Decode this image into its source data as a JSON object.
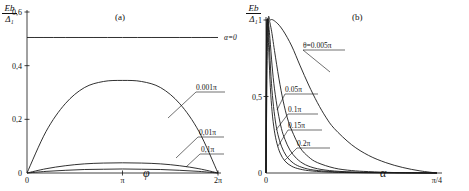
{
  "figure": {
    "panels": [
      {
        "id": "panel-a",
        "label": "(a)",
        "yaxis": {
          "title_num": "Eb",
          "title_den": "Δ₁",
          "ticks": [
            "0,6",
            "0,4",
            "0,2",
            "0"
          ],
          "tick_values": [
            0.6,
            0.4,
            0.2,
            0.0
          ],
          "range": [
            0,
            0.6
          ]
        },
        "xaxis": {
          "title": "φ",
          "ticks": [
            "0",
            "π",
            "2π"
          ],
          "tick_values": [
            0,
            3.14159,
            6.28319
          ],
          "range": [
            0,
            6.28319
          ]
        },
        "annotations": [
          {
            "name": "alpha-zero-label",
            "text": "α=0"
          },
          {
            "name": "curve-label-0001pi",
            "text": "0.001π"
          },
          {
            "name": "curve-label-001pi",
            "text": "0,01π"
          },
          {
            "name": "curve-label-01pi",
            "text": "0,1π"
          }
        ]
      },
      {
        "id": "panel-b",
        "label": "(b)",
        "yaxis": {
          "title_num": "Eb",
          "title_den": "Δ₁",
          "ticks": [
            "1",
            "0,5",
            "0"
          ],
          "tick_values": [
            1.0,
            0.5,
            0.0
          ],
          "range": [
            0,
            1.0
          ]
        },
        "xaxis": {
          "title": "α",
          "ticks": [
            "0",
            "π/4"
          ],
          "tick_values": [
            0,
            0.7854
          ],
          "range": [
            0,
            0.7854
          ]
        },
        "annotations": [
          {
            "name": "curve-label-theta-0005pi",
            "text": "θ=0.005π"
          },
          {
            "name": "curve-label-005pi",
            "text": "0.05π"
          },
          {
            "name": "curve-label-01pi",
            "text": "0.1π"
          },
          {
            "name": "curve-label-015pi",
            "text": "0.15π"
          },
          {
            "name": "curve-label-02pi",
            "text": "0.2π"
          }
        ]
      }
    ]
  },
  "chart_data": [
    {
      "type": "line",
      "panel": "(a)",
      "title": "",
      "xlabel": "φ",
      "ylabel": "Eb/Δ₁",
      "xlim": [
        0,
        6.28319
      ],
      "ylim": [
        0,
        0.6
      ],
      "xticks": [
        0,
        3.14159,
        6.28319
      ],
      "xticklabels": [
        "0",
        "π",
        "2π"
      ],
      "yticks": [
        0,
        0.2,
        0.4,
        0.6
      ],
      "yticklabels": [
        "0",
        "0,2",
        "0,4",
        "0,6"
      ],
      "grid": false,
      "legend": "inline-labels",
      "series": [
        {
          "name": "α=0",
          "style": "horizontal-line",
          "x": [
            0,
            6.28319
          ],
          "values": [
            0.505,
            0.505
          ]
        },
        {
          "name": "0.001π",
          "style": "arch",
          "x": [
            0,
            0.628,
            1.257,
            1.885,
            2.513,
            3.142,
            3.77,
            4.398,
            5.027,
            5.655,
            6.283
          ],
          "values": [
            0.0,
            0.155,
            0.258,
            0.318,
            0.341,
            0.345,
            0.341,
            0.318,
            0.258,
            0.155,
            0.0
          ]
        },
        {
          "name": "0,01π",
          "style": "shallow-arch",
          "x": [
            0,
            0.628,
            1.257,
            1.885,
            2.513,
            3.142,
            3.77,
            4.398,
            5.027,
            5.655,
            6.283
          ],
          "values": [
            0.0,
            0.016,
            0.027,
            0.034,
            0.037,
            0.038,
            0.037,
            0.034,
            0.027,
            0.016,
            0.0
          ]
        },
        {
          "name": "0,1π",
          "style": "very-shallow-arch",
          "x": [
            0,
            0.628,
            1.257,
            1.885,
            2.513,
            3.142,
            3.77,
            4.398,
            5.027,
            5.655,
            6.283
          ],
          "values": [
            0.0,
            0.006,
            0.01,
            0.013,
            0.014,
            0.015,
            0.014,
            0.013,
            0.01,
            0.006,
            0.0
          ]
        }
      ]
    },
    {
      "type": "line",
      "panel": "(b)",
      "title": "",
      "xlabel": "α",
      "ylabel": "Eb/Δ₁",
      "xlim": [
        0,
        0.7854
      ],
      "ylim": [
        0,
        1.0
      ],
      "xticks": [
        0,
        0.7854
      ],
      "xticklabels": [
        "0",
        "π/4"
      ],
      "yticks": [
        0,
        0.5,
        1.0
      ],
      "yticklabels": [
        "0",
        "0,5",
        "1"
      ],
      "grid": false,
      "legend": "inline-labels",
      "series": [
        {
          "name": "θ=0.005π",
          "x": [
            0.0,
            0.008,
            0.02,
            0.047,
            0.079,
            0.118,
            0.157,
            0.196,
            0.236,
            0.275,
            0.314,
            0.393,
            0.471,
            0.55,
            0.628,
            0.707,
            0.785
          ],
          "values": [
            0.0,
            0.93,
            1.0,
            0.985,
            0.93,
            0.83,
            0.7,
            0.575,
            0.46,
            0.365,
            0.29,
            0.185,
            0.115,
            0.068,
            0.036,
            0.014,
            0.0
          ]
        },
        {
          "name": "0.05π",
          "x": [
            0.0,
            0.004,
            0.012,
            0.024,
            0.039,
            0.059,
            0.079,
            0.098,
            0.118,
            0.157,
            0.196,
            0.236,
            0.314,
            0.393,
            0.471,
            0.589,
            0.707,
            0.785
          ],
          "values": [
            0.0,
            0.9,
            1.0,
            0.94,
            0.8,
            0.62,
            0.47,
            0.36,
            0.28,
            0.165,
            0.105,
            0.068,
            0.032,
            0.016,
            0.009,
            0.003,
            0.001,
            0.0
          ]
        },
        {
          "name": "0.1π",
          "x": [
            0.0,
            0.003,
            0.009,
            0.018,
            0.028,
            0.039,
            0.055,
            0.071,
            0.087,
            0.11,
            0.141,
            0.181,
            0.236,
            0.314,
            0.432,
            0.589,
            0.785
          ],
          "values": [
            0.0,
            0.88,
            1.0,
            0.88,
            0.7,
            0.55,
            0.4,
            0.29,
            0.22,
            0.15,
            0.094,
            0.054,
            0.028,
            0.013,
            0.005,
            0.002,
            0.0
          ]
        },
        {
          "name": "0.15π",
          "x": [
            0.0,
            0.003,
            0.008,
            0.015,
            0.023,
            0.032,
            0.043,
            0.055,
            0.071,
            0.094,
            0.126,
            0.165,
            0.22,
            0.314,
            0.432,
            0.589,
            0.785
          ],
          "values": [
            0.0,
            0.86,
            1.0,
            0.84,
            0.63,
            0.47,
            0.34,
            0.25,
            0.175,
            0.11,
            0.064,
            0.037,
            0.019,
            0.008,
            0.003,
            0.001,
            0.0
          ]
        },
        {
          "name": "0.2π",
          "x": [
            0.0,
            0.002,
            0.007,
            0.013,
            0.02,
            0.028,
            0.038,
            0.05,
            0.065,
            0.087,
            0.118,
            0.157,
            0.212,
            0.306,
            0.424,
            0.589,
            0.785
          ],
          "values": [
            0.0,
            0.84,
            1.0,
            0.79,
            0.56,
            0.4,
            0.28,
            0.195,
            0.13,
            0.078,
            0.044,
            0.025,
            0.013,
            0.005,
            0.002,
            0.001,
            0.0
          ]
        }
      ]
    }
  ]
}
